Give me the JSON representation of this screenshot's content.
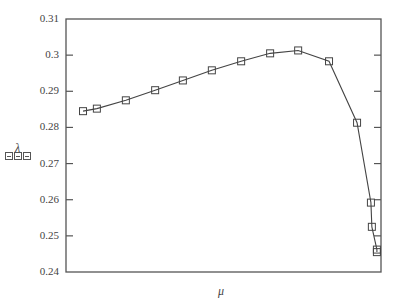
{
  "chart_data": {
    "type": "line",
    "title": "",
    "xlabel": "μ",
    "ylabel": "λ",
    "ylabel_placeholder": "⊟⊟⊟",
    "ylim": [
      0.24,
      0.31
    ],
    "yticks": [
      "0.31",
      "0.3",
      "0.29",
      "0.28",
      "0.27",
      "0.26",
      "0.25",
      "0.24"
    ],
    "ytick_values": [
      0.31,
      0.3,
      0.29,
      0.28,
      0.27,
      0.26,
      0.25,
      0.24
    ],
    "xticks": [],
    "grid": false,
    "legend": null,
    "marker": "square",
    "series": [
      {
        "name": "λ(μ)",
        "x_relative": [
          0.054,
          0.098,
          0.19,
          0.283,
          0.371,
          0.463,
          0.556,
          0.648,
          0.737,
          0.835,
          0.924,
          0.968,
          0.971,
          0.987,
          0.987
        ],
        "values": [
          0.2845,
          0.2852,
          0.2875,
          0.2903,
          0.293,
          0.2958,
          0.2983,
          0.3005,
          0.3013,
          0.2983,
          0.2813,
          0.2592,
          0.2525,
          0.2462,
          0.2455
        ]
      }
    ]
  },
  "plot_box": {
    "left": 66,
    "top": 19,
    "right": 381,
    "bottom": 272
  },
  "colors": {
    "axis": "#555555",
    "line": "#444444",
    "marker": "#444444"
  }
}
